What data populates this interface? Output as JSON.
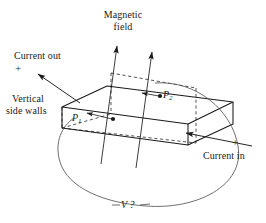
{
  "figure": {
    "width": 266,
    "height": 223,
    "background": "#ffffff",
    "stroke": "#1a1a1a"
  },
  "labels": {
    "magnetic_field_line1": "Magnetic",
    "magnetic_field_line2": "field",
    "current_out": "Current out",
    "current_out_plus": "+",
    "vertical_line1": "Vertical",
    "vertical_line2": "side walls",
    "current_in": "Current in",
    "current_in_plus": "+",
    "point_p1": "P",
    "point_p1_sub": "1",
    "point_p2": "P",
    "point_p2_sub": "2",
    "voltage": "V ?"
  },
  "icons": {
    "field_arrow": "arrow-up-right-icon",
    "current_out_arrow": "arrow-left-icon",
    "current_in_arrow": "arrow-left-into-slab-icon",
    "p1_pointer": "arrow-to-point-icon",
    "p2_pointer": "arrow-to-point-icon"
  },
  "colors": {
    "ink": "#1a1a1a",
    "light_ink": "#555555",
    "paper": "#ffffff"
  }
}
